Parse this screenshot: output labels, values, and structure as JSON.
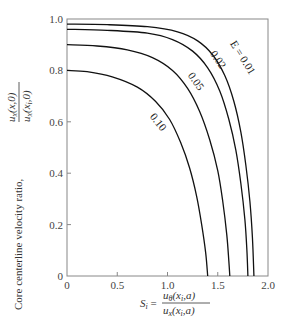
{
  "chart_data": {
    "type": "line",
    "title": "",
    "xlabel": {
      "lhs": "S",
      "lhs_sub": "i",
      "numerator": "u",
      "numerator_sub": "θ",
      "numerator_args": "(x",
      "numerator_args_sub": "i",
      "numerator_args_end": ",a)",
      "denominator": "u",
      "denominator_sub": "x",
      "denominator_args": "(x",
      "denominator_args_sub": "i",
      "denominator_args_end": ",a)"
    },
    "ylabel": {
      "text": "Core centerline velocity ratio,",
      "numerator": "u",
      "numerator_sub": "x",
      "numerator_args": "(x,0)",
      "denominator": "u",
      "denominator_sub": "x",
      "denominator_args": "(x",
      "denominator_args_sub": "i",
      "denominator_args_end": ",0)"
    },
    "xlim": [
      0,
      2.0
    ],
    "ylim": [
      0,
      1.0
    ],
    "xticks": [
      "0",
      "0.5",
      "1.0",
      "1.5",
      "2.0"
    ],
    "xtick_values": [
      0,
      0.5,
      1.0,
      1.5,
      2.0
    ],
    "yticks": [
      "0",
      "0.2",
      "0.4",
      "0.6",
      "0.8",
      "1.0"
    ],
    "ytick_values": [
      0,
      0.2,
      0.4,
      0.6,
      0.8,
      1.0
    ],
    "grid": false,
    "series": [
      {
        "name": "E = 0.01",
        "label": "E = 0.01",
        "y0": 0.98,
        "x_zero": 1.86,
        "points": [
          [
            0,
            0.98
          ],
          [
            0.4,
            0.978
          ],
          [
            0.8,
            0.97
          ],
          [
            1.1,
            0.95
          ],
          [
            1.3,
            0.915
          ],
          [
            1.45,
            0.86
          ],
          [
            1.57,
            0.78
          ],
          [
            1.66,
            0.68
          ],
          [
            1.73,
            0.56
          ],
          [
            1.78,
            0.43
          ],
          [
            1.82,
            0.29
          ],
          [
            1.845,
            0.15
          ],
          [
            1.86,
            0
          ]
        ]
      },
      {
        "name": "E = 0.02",
        "label": "0.02",
        "y0": 0.96,
        "x_zero": 1.8,
        "points": [
          [
            0,
            0.96
          ],
          [
            0.4,
            0.956
          ],
          [
            0.8,
            0.945
          ],
          [
            1.05,
            0.92
          ],
          [
            1.25,
            0.875
          ],
          [
            1.4,
            0.81
          ],
          [
            1.52,
            0.72
          ],
          [
            1.61,
            0.61
          ],
          [
            1.68,
            0.49
          ],
          [
            1.73,
            0.36
          ],
          [
            1.77,
            0.22
          ],
          [
            1.79,
            0.1
          ],
          [
            1.8,
            0
          ]
        ]
      },
      {
        "name": "E = 0.05",
        "label": "0.05",
        "y0": 0.9,
        "x_zero": 1.62,
        "points": [
          [
            0,
            0.9
          ],
          [
            0.3,
            0.895
          ],
          [
            0.6,
            0.88
          ],
          [
            0.85,
            0.85
          ],
          [
            1.05,
            0.8
          ],
          [
            1.2,
            0.73
          ],
          [
            1.32,
            0.64
          ],
          [
            1.42,
            0.53
          ],
          [
            1.5,
            0.41
          ],
          [
            1.55,
            0.29
          ],
          [
            1.59,
            0.16
          ],
          [
            1.61,
            0.06
          ],
          [
            1.62,
            0
          ]
        ]
      },
      {
        "name": "E = 0.10",
        "label": "0.10",
        "y0": 0.8,
        "x_zero": 1.4,
        "points": [
          [
            0,
            0.8
          ],
          [
            0.2,
            0.795
          ],
          [
            0.45,
            0.775
          ],
          [
            0.7,
            0.735
          ],
          [
            0.88,
            0.68
          ],
          [
            1.02,
            0.61
          ],
          [
            1.13,
            0.52
          ],
          [
            1.22,
            0.42
          ],
          [
            1.29,
            0.31
          ],
          [
            1.34,
            0.2
          ],
          [
            1.38,
            0.09
          ],
          [
            1.4,
            0
          ]
        ]
      }
    ],
    "annotations": [
      {
        "text": "E = 0.01",
        "x": 1.62,
        "y": 0.905
      },
      {
        "text": "0.02",
        "x": 1.42,
        "y": 0.865
      },
      {
        "text": "0.05",
        "x": 1.2,
        "y": 0.78
      },
      {
        "text": "0.10",
        "x": 0.82,
        "y": 0.62
      }
    ]
  }
}
